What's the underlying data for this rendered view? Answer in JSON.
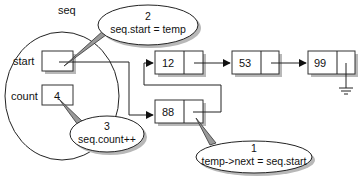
{
  "struct": {
    "name": "seq",
    "fields": [
      {
        "name": "start",
        "value": ""
      },
      {
        "name": "count",
        "value": "4"
      }
    ]
  },
  "list_nodes": [
    {
      "id": "n12",
      "value": "12"
    },
    {
      "id": "n53",
      "value": "53"
    },
    {
      "id": "n99",
      "value": "99"
    }
  ],
  "new_node": {
    "id": "n88",
    "value": "88"
  },
  "callouts": [
    {
      "step": "1",
      "text": "temp->next = seq.start"
    },
    {
      "step": "2",
      "text": "seq.start = temp"
    },
    {
      "step": "3",
      "text": "seq.count++"
    }
  ],
  "icons": {
    "null_terminator": "ground-symbol",
    "arrowhead": "filled-triangle"
  }
}
